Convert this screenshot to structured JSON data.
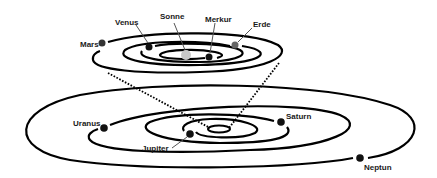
{
  "diagram": {
    "type": "solar-system-orbits",
    "inner_system": {
      "labels": {
        "mars": "Mars",
        "venus": "Venus",
        "sonne": "Sonne",
        "merkur": "Merkur",
        "erde": "Erde"
      }
    },
    "outer_system": {
      "labels": {
        "uranus": "Uranus",
        "jupiter": "Jupiter",
        "saturn": "Saturn",
        "neptun": "Neptun"
      }
    },
    "colors": {
      "orbit": "#000000",
      "planet": "#111111",
      "sun": "#c8c8c8",
      "earth": "#666666",
      "label": "#1a1a1a"
    }
  }
}
